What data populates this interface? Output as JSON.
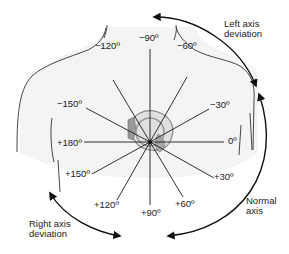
{
  "diagram": {
    "center": [
      150,
      142
    ],
    "axis_labels": [
      {
        "id": "m90",
        "text": "−90º",
        "angle": -90,
        "x": 139,
        "y": 33
      },
      {
        "id": "m120",
        "text": "−120º",
        "angle": -120,
        "x": 95,
        "y": 41
      },
      {
        "id": "m60",
        "text": "−60º",
        "angle": -60,
        "x": 177,
        "y": 41
      },
      {
        "id": "m30",
        "text": "−30º",
        "angle": -30,
        "x": 210,
        "y": 65
      },
      {
        "id": "m150",
        "text": "−150º",
        "angle": -150,
        "x": 57,
        "y": 99
      },
      {
        "id": "z0",
        "text": "0º",
        "angle": 0,
        "x": 226,
        "y": 136
      },
      {
        "id": "p180",
        "text": "+180º",
        "angle": 180,
        "x": 57,
        "y": 138
      },
      {
        "id": "p150",
        "text": "+150º",
        "angle": 150,
        "x": 65,
        "y": 169
      },
      {
        "id": "p30",
        "text": "+30º",
        "angle": 30,
        "x": 214,
        "y": 172
      },
      {
        "id": "p120",
        "text": "+120º",
        "angle": 120,
        "x": 94,
        "y": 200
      },
      {
        "id": "p90",
        "text": "+90º",
        "angle": 90,
        "x": 141,
        "y": 207
      },
      {
        "id": "p60",
        "text": "+60º",
        "angle": 60,
        "x": 176,
        "y": 199
      }
    ],
    "regions": {
      "left_axis_deviation": "Left axis\ndeviation",
      "normal_axis": "Normal\naxis",
      "right_axis_deviation": "Right axis\ndeviation"
    },
    "colors": {
      "line": "#1a1a1a",
      "body_outline": "#333333",
      "heart_fill": "#bdbdbd",
      "torso_fill": "#f4f4f4"
    }
  }
}
